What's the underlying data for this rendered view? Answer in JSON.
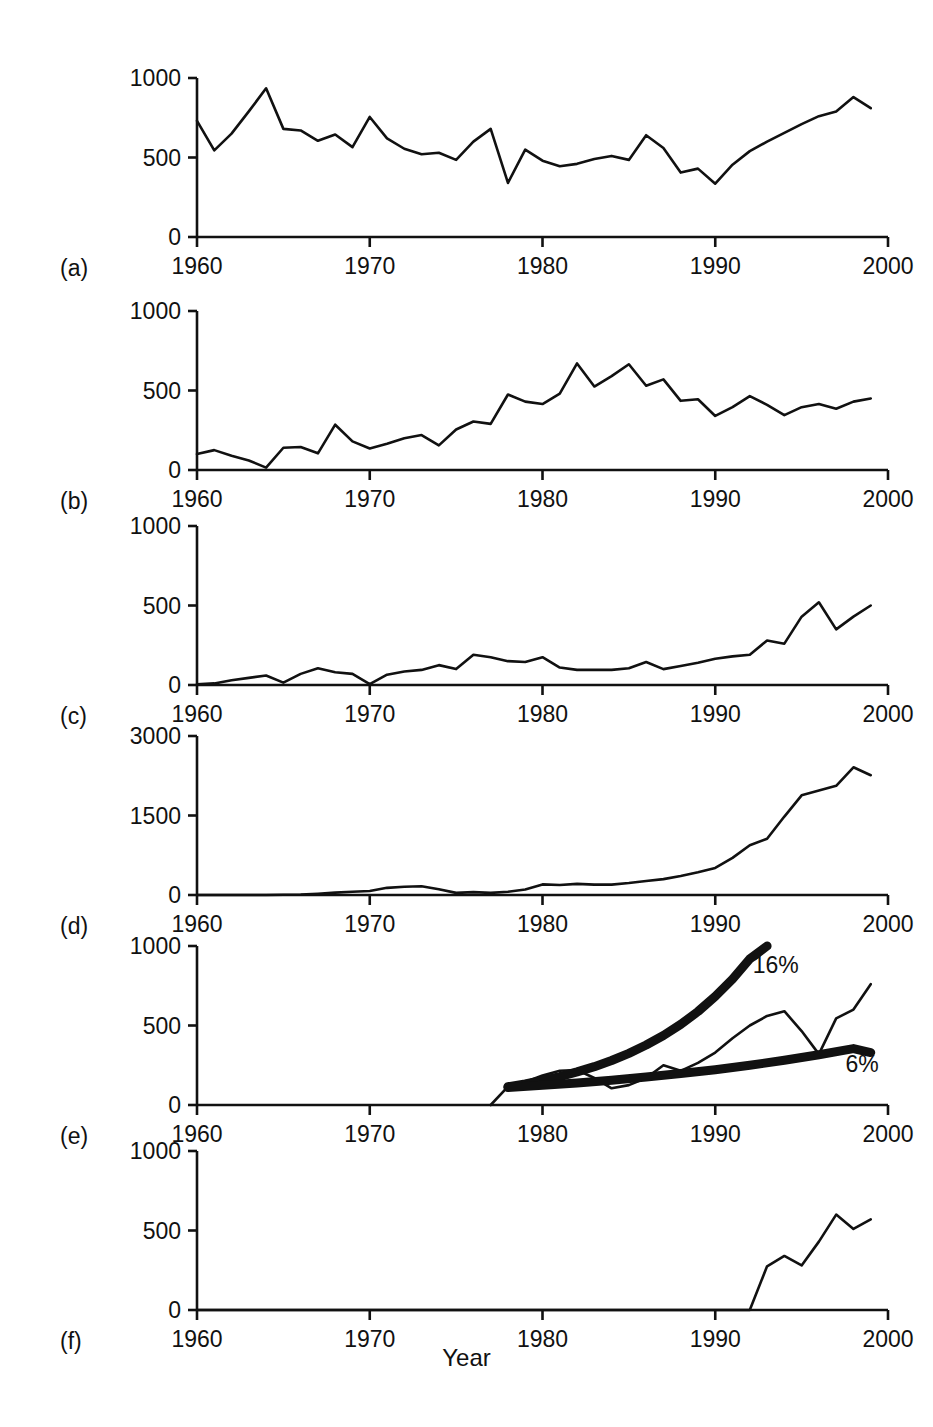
{
  "figure": {
    "xlabel": "Year",
    "ylabel": "Number of seal pups",
    "panel_tags": [
      "(a)",
      "(b)",
      "(c)",
      "(d)",
      "(e)",
      "(f)"
    ],
    "xticks": [
      "1960",
      "1970",
      "1980",
      "1990",
      "2000"
    ],
    "line_color": "#111111",
    "background": "#ffffff"
  },
  "chart_data": [
    {
      "id": "a",
      "type": "line",
      "tag": "(a)",
      "title": "",
      "xlabel": "Year",
      "ylabel": "Number of seal pups",
      "xlim": [
        1960,
        2000
      ],
      "ylim": [
        0,
        1000
      ],
      "xticks": [
        1960,
        1970,
        1980,
        1990,
        2000
      ],
      "yticks": [
        0,
        500,
        1000
      ],
      "grid": false,
      "legend": "none",
      "x": [
        1960,
        1961,
        1962,
        1963,
        1964,
        1965,
        1966,
        1967,
        1968,
        1969,
        1970,
        1971,
        1972,
        1973,
        1974,
        1975,
        1976,
        1977,
        1978,
        1979,
        1980,
        1981,
        1982,
        1983,
        1984,
        1985,
        1986,
        1987,
        1988,
        1989,
        1990,
        1991,
        1992,
        1993,
        1994,
        1995,
        1996,
        1997,
        1998,
        1999
      ],
      "values": [
        730,
        545,
        650,
        790,
        935,
        680,
        670,
        605,
        645,
        565,
        755,
        620,
        555,
        520,
        530,
        485,
        600,
        680,
        340,
        550,
        480,
        445,
        460,
        490,
        510,
        485,
        640,
        560,
        405,
        430,
        335,
        455,
        540,
        600,
        655,
        710,
        760,
        790,
        880,
        810
      ]
    },
    {
      "id": "b",
      "type": "line",
      "tag": "(b)",
      "xlim": [
        1960,
        2000
      ],
      "ylim": [
        0,
        1000
      ],
      "xticks": [
        1960,
        1970,
        1980,
        1990,
        2000
      ],
      "yticks": [
        0,
        500,
        1000
      ],
      "grid": false,
      "legend": "none",
      "x": [
        1960,
        1961,
        1962,
        1963,
        1964,
        1965,
        1966,
        1967,
        1968,
        1969,
        1970,
        1971,
        1972,
        1973,
        1974,
        1975,
        1976,
        1977,
        1978,
        1979,
        1980,
        1981,
        1982,
        1983,
        1984,
        1985,
        1986,
        1987,
        1988,
        1989,
        1990,
        1991,
        1992,
        1993,
        1994,
        1995,
        1996,
        1997,
        1998,
        1999
      ],
      "values": [
        100,
        125,
        90,
        60,
        15,
        140,
        145,
        105,
        285,
        180,
        135,
        165,
        200,
        220,
        155,
        255,
        305,
        290,
        475,
        430,
        415,
        480,
        670,
        525,
        590,
        665,
        530,
        570,
        435,
        445,
        340,
        395,
        465,
        410,
        345,
        395,
        415,
        385,
        430,
        450
      ]
    },
    {
      "id": "c",
      "type": "line",
      "tag": "(c)",
      "xlim": [
        1960,
        2000
      ],
      "ylim": [
        0,
        1000
      ],
      "xticks": [
        1960,
        1970,
        1980,
        1990,
        2000
      ],
      "yticks": [
        0,
        500,
        1000
      ],
      "grid": false,
      "legend": "none",
      "x": [
        1960,
        1961,
        1962,
        1963,
        1964,
        1965,
        1966,
        1967,
        1968,
        1969,
        1970,
        1971,
        1972,
        1973,
        1974,
        1975,
        1976,
        1977,
        1978,
        1979,
        1980,
        1981,
        1982,
        1983,
        1984,
        1985,
        1986,
        1987,
        1988,
        1989,
        1990,
        1991,
        1992,
        1993,
        1994,
        1995,
        1996,
        1997,
        1998,
        1999
      ],
      "values": [
        5,
        10,
        30,
        45,
        60,
        15,
        70,
        105,
        80,
        70,
        5,
        65,
        85,
        95,
        125,
        100,
        190,
        175,
        150,
        145,
        175,
        110,
        95,
        95,
        95,
        105,
        145,
        100,
        120,
        140,
        165,
        180,
        190,
        280,
        260,
        430,
        520,
        350,
        430,
        500
      ]
    },
    {
      "id": "d",
      "type": "line",
      "tag": "(d)",
      "xlim": [
        1960,
        2000
      ],
      "ylim": [
        0,
        3000
      ],
      "xticks": [
        1960,
        1970,
        1980,
        1990,
        2000
      ],
      "yticks": [
        0,
        1500,
        3000
      ],
      "grid": false,
      "legend": "none",
      "x": [
        1960,
        1961,
        1962,
        1963,
        1964,
        1965,
        1966,
        1967,
        1968,
        1969,
        1970,
        1971,
        1972,
        1973,
        1974,
        1975,
        1976,
        1977,
        1978,
        1979,
        1980,
        1981,
        1982,
        1983,
        1984,
        1985,
        1986,
        1987,
        1988,
        1989,
        1990,
        1991,
        1992,
        1993,
        1994,
        1995,
        1996,
        1997,
        1998,
        1999
      ],
      "values": [
        0,
        0,
        0,
        0,
        0,
        5,
        10,
        25,
        45,
        60,
        75,
        135,
        155,
        165,
        110,
        40,
        55,
        40,
        60,
        105,
        200,
        190,
        210,
        195,
        195,
        225,
        265,
        300,
        360,
        430,
        510,
        700,
        940,
        1060,
        1480,
        1880,
        1970,
        2060,
        2410,
        2260
      ]
    },
    {
      "id": "e",
      "type": "line",
      "tag": "(e)",
      "xlim": [
        1960,
        2000
      ],
      "ylim": [
        0,
        1000
      ],
      "xticks": [
        1960,
        1970,
        1980,
        1990,
        2000
      ],
      "yticks": [
        0,
        500,
        1000
      ],
      "grid": false,
      "legend": "inline-annotations",
      "annotations": [
        {
          "text": "16%",
          "x": 1993.5,
          "y": 880
        },
        {
          "text": "6%",
          "x": 1998.5,
          "y": 255
        }
      ],
      "series": [
        {
          "name": "observed",
          "style": "thin",
          "x": [
            1977,
            1978,
            1979,
            1980,
            1981,
            1982,
            1983,
            1984,
            1985,
            1986,
            1987,
            1988,
            1989,
            1990,
            1991,
            1992,
            1993,
            1994,
            1995,
            1996,
            1997,
            1998,
            1999
          ],
          "values": [
            0,
            115,
            145,
            185,
            215,
            220,
            170,
            105,
            125,
            170,
            250,
            215,
            265,
            330,
            420,
            500,
            560,
            590,
            465,
            320,
            545,
            600,
            760,
            695
          ]
        },
        {
          "name": "16% growth model",
          "style": "thick",
          "x": [
            1978,
            1979,
            1980,
            1981,
            1982,
            1983,
            1984,
            1985,
            1986,
            1987,
            1988,
            1989,
            1990,
            1991,
            1992,
            1993
          ],
          "values": [
            115,
            133,
            155,
            179,
            208,
            241,
            280,
            325,
            377,
            437,
            507,
            588,
            683,
            792,
            919,
            1000
          ]
        },
        {
          "name": "6% growth model",
          "style": "thick",
          "x": [
            1978,
            1980,
            1982,
            1984,
            1986,
            1988,
            1990,
            1992,
            1994,
            1996,
            1998,
            1999
          ],
          "values": [
            110,
            124,
            139,
            156,
            176,
            198,
            222,
            250,
            281,
            316,
            355,
            330
          ]
        }
      ]
    },
    {
      "id": "f",
      "type": "line",
      "tag": "(f)",
      "xlim": [
        1960,
        2000
      ],
      "ylim": [
        0,
        1000
      ],
      "xticks": [
        1960,
        1970,
        1980,
        1990,
        2000
      ],
      "yticks": [
        0,
        500,
        1000
      ],
      "grid": false,
      "legend": "none",
      "x": [
        1960,
        1992,
        1993,
        1994,
        1995,
        1996,
        1997,
        1998,
        1999
      ],
      "values": [
        0,
        0,
        275,
        340,
        280,
        430,
        600,
        510,
        570
      ]
    }
  ]
}
